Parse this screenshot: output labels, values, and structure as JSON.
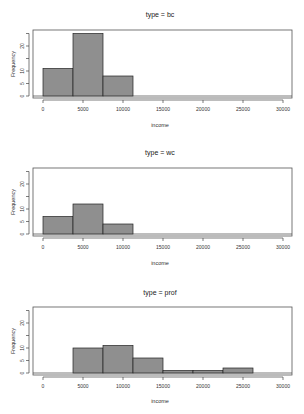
{
  "chart_data": [
    {
      "type": "bar",
      "title": "type = bc",
      "xlabel": "income",
      "ylabel": "Frequency",
      "bin_edges": [
        0,
        3750,
        7500,
        11250
      ],
      "values": [
        11,
        25,
        8
      ],
      "xlim": [
        0,
        30000
      ],
      "ylim": [
        0,
        25
      ],
      "xticks": [
        0,
        5000,
        10000,
        15000,
        20000,
        25000,
        30000
      ],
      "yticks": [
        0,
        5,
        10,
        15,
        20,
        25
      ],
      "ytick_labels": [
        "0",
        "5",
        "10",
        "",
        "20",
        ""
      ],
      "grid": false,
      "bar_color": "#8f8f8f"
    },
    {
      "type": "bar",
      "title": "type = wc",
      "xlabel": "income",
      "ylabel": "Frequency",
      "bin_edges": [
        0,
        3750,
        7500,
        11250
      ],
      "values": [
        7,
        12,
        4
      ],
      "xlim": [
        0,
        30000
      ],
      "ylim": [
        0,
        25
      ],
      "xticks": [
        0,
        5000,
        10000,
        15000,
        20000,
        25000,
        30000
      ],
      "yticks": [
        0,
        5,
        10,
        15,
        20,
        25
      ],
      "ytick_labels": [
        "0",
        "5",
        "10",
        "",
        "20",
        ""
      ],
      "grid": false,
      "bar_color": "#8f8f8f"
    },
    {
      "type": "bar",
      "title": "type = prof",
      "xlabel": "income",
      "ylabel": "Frequency",
      "bin_edges": [
        3750,
        7500,
        11250,
        15000,
        18750,
        22500,
        26250
      ],
      "values": [
        10,
        11,
        6,
        1,
        1,
        2
      ],
      "xlim": [
        0,
        30000
      ],
      "ylim": [
        0,
        25
      ],
      "xticks": [
        0,
        5000,
        10000,
        15000,
        20000,
        25000,
        30000
      ],
      "yticks": [
        0,
        5,
        10,
        15,
        20,
        25
      ],
      "ytick_labels": [
        "0",
        "5",
        "10",
        "",
        "20",
        ""
      ],
      "grid": false,
      "bar_color": "#8f8f8f"
    }
  ],
  "panels": [
    {
      "title": "type = bc",
      "xlabel": "income",
      "ylabel": "Frequency"
    },
    {
      "title": "type = wc",
      "xlabel": "income",
      "ylabel": "Frequency"
    },
    {
      "title": "type = prof",
      "xlabel": "income",
      "ylabel": "Frequency"
    }
  ],
  "xtick_labels": [
    "0",
    "5000",
    "10000",
    "15000",
    "20000",
    "25000",
    "30000"
  ]
}
